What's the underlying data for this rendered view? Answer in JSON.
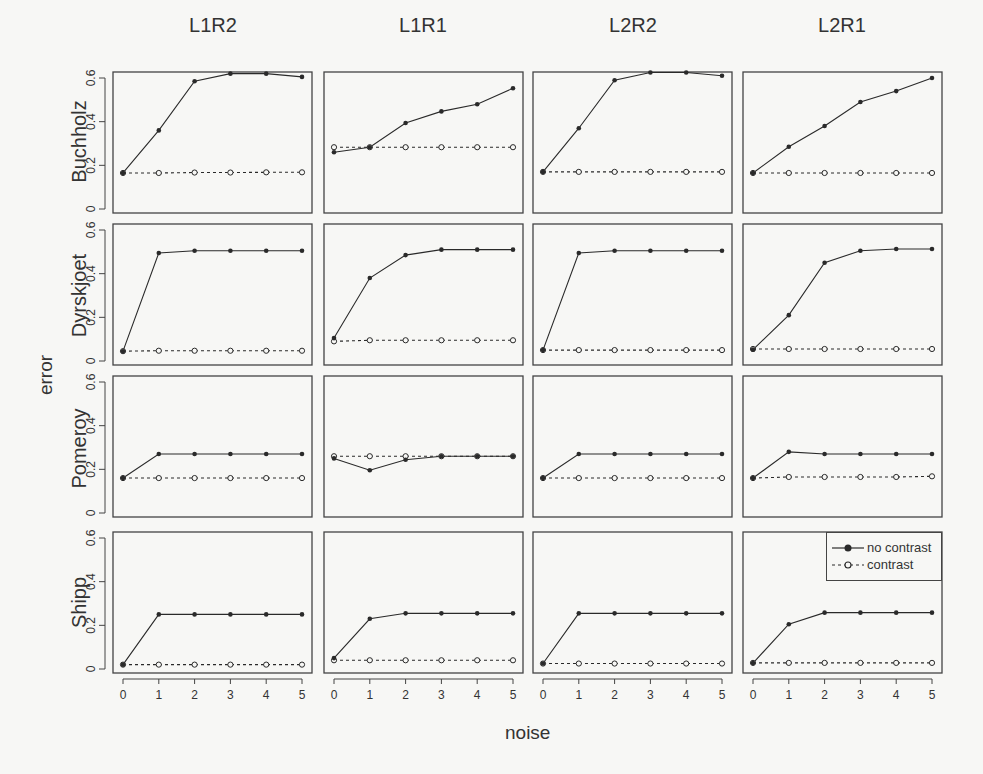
{
  "chart_data": {
    "type": "line",
    "layout": "small-multiples 4x4 grid",
    "xlabel": "noise",
    "ylabel": "error",
    "x": [
      0,
      1,
      2,
      3,
      4,
      5
    ],
    "x_ticks": [
      "0",
      "1",
      "2",
      "3",
      "4",
      "5"
    ],
    "ylim": [
      0,
      0.6
    ],
    "y_ticks": [
      "0",
      "0.2",
      "0.4",
      "0.6"
    ],
    "grid": false,
    "columns": [
      "L1R2",
      "L1R1",
      "L2R2",
      "L2R1"
    ],
    "rows": [
      "Buchholz",
      "Dyrskjoet",
      "Pomeroy",
      "Shipp"
    ],
    "legend": {
      "position": "inside bottom-right panel, top-right corner",
      "entries": [
        {
          "label": "no contrast",
          "marker": "filled-circle",
          "line": "solid"
        },
        {
          "label": "contrast",
          "marker": "open-circle",
          "line": "dashed"
        }
      ]
    },
    "panels": {
      "Buchholz": {
        "L1R2": {
          "no_contrast": [
            0.165,
            0.36,
            0.585,
            0.62,
            0.62,
            0.605
          ],
          "contrast": [
            0.165,
            0.165,
            0.167,
            0.167,
            0.168,
            0.168
          ]
        },
        "L1R1": {
          "no_contrast": [
            0.26,
            0.283,
            0.394,
            0.447,
            0.48,
            0.553
          ],
          "contrast": [
            0.283,
            0.283,
            0.283,
            0.283,
            0.283,
            0.283
          ]
        },
        "L2R2": {
          "no_contrast": [
            0.17,
            0.37,
            0.59,
            0.625,
            0.625,
            0.61
          ],
          "contrast": [
            0.17,
            0.17,
            0.17,
            0.17,
            0.17,
            0.17
          ]
        },
        "L2R1": {
          "no_contrast": [
            0.165,
            0.285,
            0.38,
            0.49,
            0.54,
            0.6
          ],
          "contrast": [
            0.165,
            0.165,
            0.165,
            0.165,
            0.165,
            0.165
          ]
        }
      },
      "Dyrskjoet": {
        "L1R2": {
          "no_contrast": [
            0.045,
            0.495,
            0.505,
            0.505,
            0.505,
            0.505
          ],
          "contrast": [
            0.045,
            0.047,
            0.047,
            0.047,
            0.047,
            0.047
          ]
        },
        "L1R1": {
          "no_contrast": [
            0.105,
            0.38,
            0.485,
            0.51,
            0.51,
            0.51
          ],
          "contrast": [
            0.09,
            0.095,
            0.095,
            0.095,
            0.095,
            0.095
          ]
        },
        "L2R2": {
          "no_contrast": [
            0.05,
            0.495,
            0.505,
            0.505,
            0.505,
            0.505
          ],
          "contrast": [
            0.05,
            0.05,
            0.05,
            0.05,
            0.05,
            0.05
          ]
        },
        "L2R1": {
          "no_contrast": [
            0.052,
            0.21,
            0.45,
            0.505,
            0.513,
            0.513
          ],
          "contrast": [
            0.055,
            0.055,
            0.055,
            0.055,
            0.055,
            0.055
          ]
        }
      },
      "Pomeroy": {
        "L1R2": {
          "no_contrast": [
            0.16,
            0.27,
            0.27,
            0.27,
            0.27,
            0.27
          ],
          "contrast": [
            0.16,
            0.16,
            0.16,
            0.16,
            0.16,
            0.16
          ]
        },
        "L1R1": {
          "no_contrast": [
            0.25,
            0.196,
            0.244,
            0.26,
            0.26,
            0.26
          ],
          "contrast": [
            0.26,
            0.26,
            0.26,
            0.26,
            0.26,
            0.26
          ]
        },
        "L2R2": {
          "no_contrast": [
            0.16,
            0.27,
            0.27,
            0.27,
            0.27,
            0.27
          ],
          "contrast": [
            0.16,
            0.16,
            0.16,
            0.16,
            0.16,
            0.16
          ]
        },
        "L2R1": {
          "no_contrast": [
            0.16,
            0.28,
            0.27,
            0.27,
            0.27,
            0.27
          ],
          "contrast": [
            0.16,
            0.165,
            0.165,
            0.165,
            0.165,
            0.168
          ]
        }
      },
      "Shipp": {
        "L1R2": {
          "no_contrast": [
            0.02,
            0.25,
            0.25,
            0.25,
            0.25,
            0.25
          ],
          "contrast": [
            0.02,
            0.02,
            0.02,
            0.02,
            0.02,
            0.02
          ]
        },
        "L1R1": {
          "no_contrast": [
            0.05,
            0.23,
            0.255,
            0.255,
            0.255,
            0.255
          ],
          "contrast": [
            0.04,
            0.04,
            0.04,
            0.04,
            0.04,
            0.04
          ]
        },
        "L2R2": {
          "no_contrast": [
            0.025,
            0.255,
            0.255,
            0.255,
            0.255,
            0.255
          ],
          "contrast": [
            0.025,
            0.025,
            0.025,
            0.025,
            0.025,
            0.025
          ]
        },
        "L2R1": {
          "no_contrast": [
            0.027,
            0.205,
            0.258,
            0.258,
            0.258,
            0.258
          ],
          "contrast": [
            0.028,
            0.028,
            0.028,
            0.028,
            0.028,
            0.028
          ]
        }
      }
    }
  },
  "colors": {
    "background": "#f7f7f5",
    "frame": "#444444",
    "series": "#2a2a2a"
  }
}
